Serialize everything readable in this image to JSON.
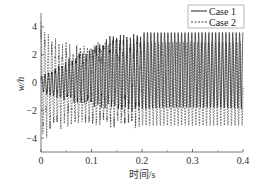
{
  "chart_data": {
    "type": "line",
    "title": "",
    "xlabel": "时间/s",
    "ylabel": "w/h",
    "xlim": [
      0,
      0.4
    ],
    "ylim": [
      -5,
      5
    ],
    "xticks": [
      0,
      0.1,
      0.2,
      0.3,
      0.4
    ],
    "xtick_labels": [
      "0",
      "0.1",
      "0.2",
      "0.3",
      "0.4"
    ],
    "yticks": [
      4,
      2,
      0,
      -2,
      -4
    ],
    "ytick_labels": [
      "4",
      "2",
      "0",
      "−2",
      "−4"
    ],
    "grid": false,
    "legend_position": "upper right",
    "series": [
      {
        "name": "Case 1",
        "style": "solid",
        "color": "#222222",
        "description": "High-frequency oscillation starting near 0, amplitude grows; settles to max ≈ 3.6, min ≈ -1.9 after t ≈ 0.2 s",
        "envelope": {
          "t": [
            0,
            0.02,
            0.05,
            0.08,
            0.1,
            0.12,
            0.15,
            0.18,
            0.2,
            0.25,
            0.3,
            0.35,
            0.4
          ],
          "max": [
            0.5,
            0.8,
            1.5,
            2.2,
            2.5,
            3.0,
            3.4,
            3.5,
            3.6,
            3.6,
            3.6,
            3.6,
            3.6
          ],
          "min": [
            -0.6,
            -1.0,
            -1.3,
            -1.5,
            -1.6,
            -1.8,
            -2.0,
            -2.0,
            -1.9,
            -1.8,
            -1.8,
            -1.8,
            -1.9
          ]
        }
      },
      {
        "name": "Case 2",
        "style": "dashed",
        "color": "#444444",
        "description": "Starts at ±4.3, decays quickly; sustained oscillation max ≈ 2.8–3.0, min ≈ -3.1",
        "envelope": {
          "t": [
            0,
            0.01,
            0.02,
            0.05,
            0.08,
            0.1,
            0.15,
            0.2,
            0.25,
            0.3,
            0.35,
            0.4
          ],
          "max": [
            4.3,
            3.5,
            3.1,
            2.8,
            2.7,
            2.7,
            2.8,
            2.9,
            2.9,
            2.9,
            2.9,
            2.9
          ],
          "min": [
            -4.4,
            -3.8,
            -3.3,
            -3.0,
            -3.1,
            -3.1,
            -3.1,
            -3.1,
            -3.1,
            -3.1,
            -3.1,
            -3.1
          ]
        }
      }
    ]
  },
  "legend": {
    "items": [
      {
        "label": "Case 1",
        "style": "solid"
      },
      {
        "label": "Case 2",
        "style": "dashed"
      }
    ]
  },
  "axes": {
    "xlabel": "时间/s",
    "ylabel": "w/h"
  }
}
